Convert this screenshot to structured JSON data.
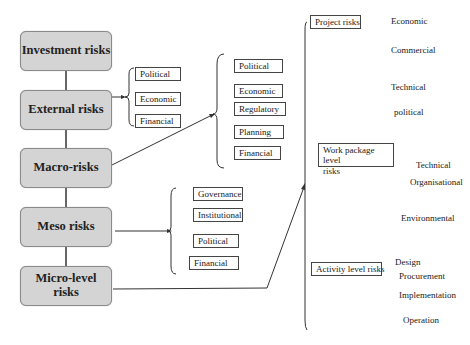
{
  "levels": {
    "investment": "Investment risks",
    "external": "External risks",
    "macro": "Macro-risks",
    "meso": "Meso risks",
    "micro_1": "Micro-level",
    "micro_2": "risks"
  },
  "external_items": [
    "Political",
    "Economic",
    "Financial"
  ],
  "macro_items": [
    "Political",
    "Economic",
    "Regulatory",
    "Planning",
    "Financial"
  ],
  "meso_items": [
    "Governance",
    "Institutional",
    "Political",
    "Financial"
  ],
  "micro": {
    "project": {
      "label": "Project risks",
      "items": [
        "Economic",
        "Commercial",
        "Technical",
        "political"
      ]
    },
    "work_package": {
      "label_1": "Work package level",
      "label_2": "risks",
      "items": [
        "Technical",
        "Organisational",
        "Environmental"
      ]
    },
    "activity": {
      "label": "Activity level risks",
      "items": [
        "Design",
        "Procurement",
        "Implementation",
        "Operation"
      ]
    }
  }
}
